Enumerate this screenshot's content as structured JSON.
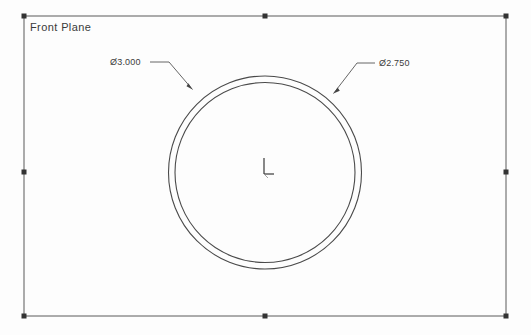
{
  "document": {
    "plane_label": "Front Plane",
    "background_color": "#fdfdfd",
    "line_color": "#444444"
  },
  "sketch": {
    "origin": {
      "name": "origin-marker",
      "x": 265,
      "y": 172
    },
    "circles": [
      {
        "name": "outer-circle",
        "cx": 265,
        "cy": 172.5,
        "r": 96.5,
        "diameter_label": "Ø3.000"
      },
      {
        "name": "inner-circle",
        "cx": 265,
        "cy": 172.5,
        "r": 90.0,
        "diameter_label": "Ø2.750"
      }
    ]
  },
  "dimensions": {
    "outer": {
      "text": "Ø3.000",
      "leader_start_x": 150,
      "leader_start_y": 62,
      "leader_elbow_x": 168,
      "leader_elbow_y": 62,
      "arrow_x": 192,
      "arrow_y": 89
    },
    "inner": {
      "text": "Ø2.750",
      "leader_start_x": 375,
      "leader_start_y": 63,
      "leader_elbow_x": 357,
      "leader_elbow_y": 63,
      "arrow_x": 334,
      "arrow_y": 93
    }
  },
  "bounding_box": {
    "name": "plane-boundary",
    "left": 24,
    "top": 16,
    "right": 506,
    "bottom": 316,
    "handles": [
      {
        "name": "handle-top-left",
        "x": 24,
        "y": 16
      },
      {
        "name": "handle-top-center",
        "x": 265,
        "y": 16
      },
      {
        "name": "handle-top-right",
        "x": 506,
        "y": 16
      },
      {
        "name": "handle-middle-left",
        "x": 24,
        "y": 172
      },
      {
        "name": "handle-middle-right",
        "x": 506,
        "y": 172
      },
      {
        "name": "handle-bottom-left",
        "x": 24,
        "y": 316
      },
      {
        "name": "handle-bottom-center",
        "x": 265,
        "y": 316
      },
      {
        "name": "handle-bottom-right",
        "x": 506,
        "y": 316
      }
    ]
  }
}
